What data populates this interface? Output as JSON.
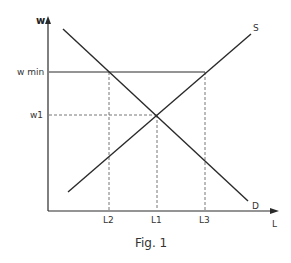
{
  "diagram": {
    "type": "labour-market-minimum-wage",
    "caption": "Fig. 1",
    "axes": {
      "y_label": "w",
      "x_label": "L"
    },
    "curves": {
      "supply_label": "S",
      "demand_label": "D"
    },
    "y_ticks": {
      "wmin": "w min",
      "w1": "w1"
    },
    "x_ticks": {
      "L2": "L2",
      "L1": "L1",
      "L3": "L3"
    },
    "colors": {
      "line": "#2a2a2a",
      "dashed": "#666666",
      "text": "#333333"
    }
  }
}
